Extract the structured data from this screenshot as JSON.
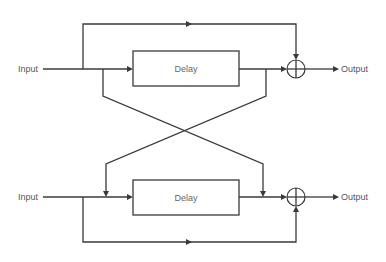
{
  "diagram": {
    "type": "signal-flow",
    "channels": [
      {
        "input_label": "Input",
        "delay_label": "Delay",
        "output_label": "Output",
        "summing_junction": "plus"
      },
      {
        "input_label": "Input",
        "delay_label": "Delay",
        "output_label": "Output",
        "summing_junction": "plus"
      }
    ],
    "connections": [
      "Input 1 -> Delay 1",
      "Input 1 -> Sum 1 (direct bypass, top path)",
      "Input 1 -> Delay 2 input (cross path)",
      "Delay 1 -> Sum 1",
      "Delay 1 output -> Delay 2 output / Sum 2 (cross path)",
      "Input 2 -> Delay 2",
      "Input 2 -> Sum 2 (direct bypass, bottom path)",
      "Delay 2 -> Sum 2",
      "Sum 1 -> Output 1",
      "Sum 2 -> Output 2"
    ],
    "colors": {
      "line": "#3a3a3a",
      "text": "#555555",
      "background": "#ffffff"
    }
  }
}
